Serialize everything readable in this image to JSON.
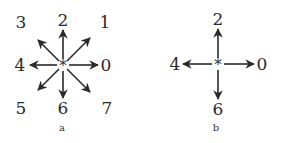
{
  "diagrams": [
    {
      "caption": "a",
      "center_symbol": "*",
      "directions": [
        {
          "label": "0",
          "angle_deg": 0
        },
        {
          "label": "1",
          "angle_deg": 45
        },
        {
          "label": "2",
          "angle_deg": 90
        },
        {
          "label": "3",
          "angle_deg": 135
        },
        {
          "label": "4",
          "angle_deg": 180
        },
        {
          "label": "5",
          "angle_deg": 225
        },
        {
          "label": "6",
          "angle_deg": 270
        },
        {
          "label": "7",
          "angle_deg": 315
        }
      ]
    },
    {
      "caption": "b",
      "center_symbol": "*",
      "directions": [
        {
          "label": "0",
          "angle_deg": 0
        },
        {
          "label": "2",
          "angle_deg": 90
        },
        {
          "label": "4",
          "angle_deg": 180
        },
        {
          "label": "6",
          "angle_deg": 270
        }
      ]
    }
  ],
  "colors": {
    "stroke": "#2a2a2a",
    "background": "#ffffff"
  }
}
